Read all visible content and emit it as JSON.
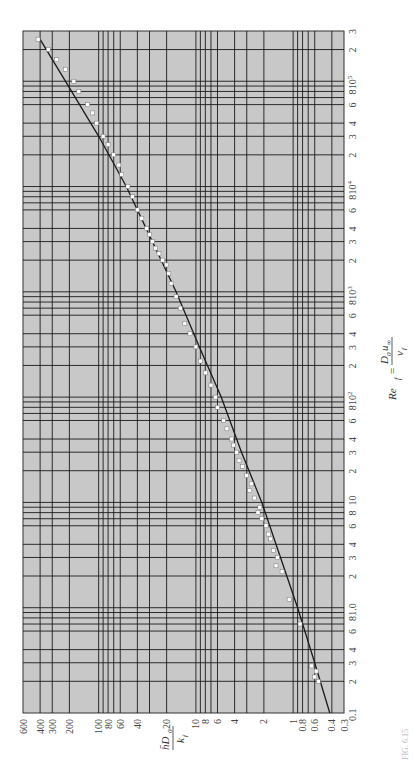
{
  "chart_data": {
    "type": "scatter",
    "orientation": "rotated-90",
    "title": "",
    "xlabel": "Re_f = D_0 u_inf / v_f",
    "ylabel": "h D_0 / k_f",
    "xscale": "log",
    "yscale": "log",
    "xlim": [
      0.1,
      300000
    ],
    "ylim": [
      0.3,
      600
    ],
    "grid": true,
    "x_tick_labels": [
      "0.1",
      "2",
      "3",
      "4",
      "6",
      "8",
      "1.0",
      "2",
      "3",
      "4",
      "6",
      "8",
      "10",
      "2",
      "3",
      "4",
      "6",
      "8",
      "10^2",
      "2",
      "3",
      "4",
      "6",
      "8",
      "10^3",
      "2",
      "3",
      "4",
      "6",
      "8",
      "10^4",
      "2",
      "3",
      "4",
      "6",
      "8",
      "10^5",
      "2",
      "3"
    ],
    "y_tick_labels": [
      "0.3",
      "0.4",
      "0.6",
      "0.8",
      "1",
      "2",
      "4",
      "6",
      "8",
      "10",
      "20",
      "40",
      "60",
      "80",
      "100",
      "200",
      "300",
      "400",
      "600"
    ],
    "series": [
      {
        "name": "correlation curve",
        "type": "line",
        "x": [
          0.1,
          0.3,
          1,
          3,
          10,
          30,
          100,
          300,
          1000,
          3000,
          10000,
          30000,
          100000,
          250000
        ],
        "y": [
          0.42,
          0.6,
          0.9,
          1.35,
          2.1,
          3.4,
          5.5,
          9.2,
          16,
          28,
          52,
          100,
          220,
          400
        ]
      },
      {
        "name": "experimental data",
        "type": "scatter",
        "x": [
          0.2,
          0.22,
          0.25,
          0.28,
          0.7,
          1.2,
          2.2,
          2.5,
          3,
          3.5,
          4.5,
          5,
          6,
          7,
          8,
          9,
          11,
          13,
          15,
          18,
          22,
          25,
          30,
          35,
          40,
          50,
          60,
          80,
          100,
          130,
          170,
          220,
          300,
          400,
          500,
          700,
          900,
          1200,
          1500,
          1800,
          2000,
          2300,
          2600,
          3000,
          3500,
          4000,
          5000,
          6000,
          8000,
          10000,
          13000,
          16000,
          20000,
          25000,
          30000,
          40000,
          50000,
          60000,
          80000,
          100000,
          130000,
          160000,
          200000,
          250000
        ],
        "y": [
          0.55,
          0.6,
          0.58,
          0.65,
          0.85,
          1.1,
          1.3,
          1.5,
          1.45,
          1.6,
          1.7,
          1.8,
          1.9,
          2.1,
          2.3,
          2.2,
          2.5,
          2.8,
          2.7,
          3.0,
          3.3,
          3.6,
          3.8,
          4.1,
          4.3,
          4.8,
          5.2,
          6.0,
          6.3,
          7.0,
          8.0,
          9.0,
          10,
          11.5,
          13,
          14.5,
          16,
          18,
          19,
          20,
          22,
          24,
          26,
          28,
          30,
          32,
          36,
          40,
          45,
          50,
          58,
          62,
          70,
          80,
          90,
          105,
          115,
          130,
          160,
          180,
          220,
          270,
          330,
          420
        ]
      }
    ]
  },
  "figure": {
    "x_axis_title": "Re",
    "x_axis_subscript": "f",
    "x_axis_numer": "D",
    "x_axis_numer_sub": "0",
    "x_axis_numer_var": "u",
    "x_axis_numer_var_sub": "∞",
    "x_axis_denom": "v",
    "x_axis_denom_sub": "f",
    "y_axis_numer": "h̄D",
    "y_axis_numer_sub": "0",
    "y_axis_denom": "k",
    "y_axis_denom_sub": "f",
    "caption_fragment": "FIG. 6.15"
  },
  "colors": {
    "plot_background": "#c8c8c8",
    "grid_line": "#1a1a1a",
    "curve": "#1a1a1a",
    "marker_fill": "#ffffff",
    "marker_edge": "#666666"
  }
}
